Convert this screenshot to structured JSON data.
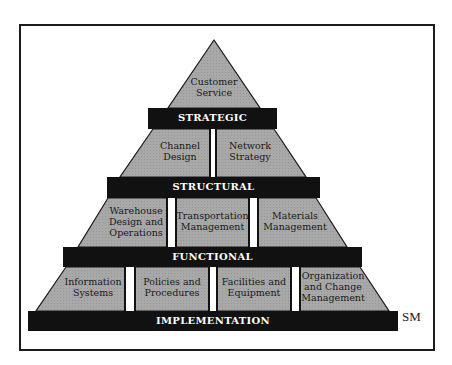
{
  "diagram": {
    "type": "pyramid",
    "fill_color": "#a6a6a6",
    "band_color": "#111111",
    "tiers": [
      {
        "level": "STRATEGIC",
        "blocks": [
          {
            "label_lines": [
              "Customer",
              "Service"
            ]
          }
        ]
      },
      {
        "level": "STRUCTURAL",
        "blocks": [
          {
            "label_lines": [
              "Channel",
              "Design"
            ]
          },
          {
            "label_lines": [
              "Network",
              "Strategy"
            ]
          }
        ]
      },
      {
        "level": "FUNCTIONAL",
        "blocks": [
          {
            "label_lines": [
              "Warehouse",
              "Design and",
              "Operations"
            ]
          },
          {
            "label_lines": [
              "Transportation",
              "Management"
            ]
          },
          {
            "label_lines": [
              "Materials",
              "Management"
            ]
          }
        ]
      },
      {
        "level": "IMPLEMENTATION",
        "blocks": [
          {
            "label_lines": [
              "Information",
              "Systems"
            ]
          },
          {
            "label_lines": [
              "Policies and",
              "Procedures"
            ]
          },
          {
            "label_lines": [
              "Facilities and",
              "Equipment"
            ]
          },
          {
            "label_lines": [
              "Organization",
              "and Change",
              "Management"
            ]
          }
        ]
      }
    ],
    "mark": "SM"
  }
}
